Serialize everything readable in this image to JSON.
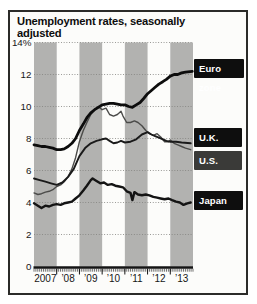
{
  "figure": {
    "title": "Unemployment rates, seasonally adjusted"
  },
  "colors": {
    "background": "#fcfcfa",
    "border": "#2b2b29",
    "year_band": "#b2b2b0",
    "gridline": "#82827f",
    "axis": "#141414",
    "tick_label": "#161616",
    "label_box_text": "#ffffff"
  },
  "chart_data": {
    "type": "line",
    "title": "Unemployment rates, seasonally adjusted",
    "unit": "percent",
    "xlabel": "",
    "ylabel": "",
    "x_range": [
      2007,
      2014
    ],
    "ylim": [
      0,
      14
    ],
    "grid": "dotted-horizontal",
    "shaded_year_bands": [
      2007,
      2009,
      2011,
      2013
    ],
    "y_ticks": [
      {
        "label": "14%",
        "value": 14
      },
      {
        "label": "12",
        "value": 12
      },
      {
        "label": "10",
        "value": 10
      },
      {
        "label": "8",
        "value": 8
      },
      {
        "label": "6",
        "value": 6
      },
      {
        "label": "4",
        "value": 4
      },
      {
        "label": "2",
        "value": 2
      },
      {
        "label": "0",
        "value": 0
      }
    ],
    "x_ticks": [
      {
        "label": "2007",
        "year": 2007
      },
      {
        "label": "’08",
        "year": 2008
      },
      {
        "label": "’09",
        "year": 2009
      },
      {
        "label": "’10",
        "year": 2010
      },
      {
        "label": "’11",
        "year": 2011
      },
      {
        "label": "’12",
        "year": 2012
      },
      {
        "label": "’13",
        "year": 2013
      }
    ],
    "legend": {
      "position": "right",
      "style": "black-label-boxes"
    },
    "series": [
      {
        "name": "Euro zone",
        "color": "#0d0d0d",
        "stroke_width": 2.8,
        "label_bg": "#0e0e0e",
        "points": [
          [
            2007.0,
            7.6
          ],
          [
            2007.17,
            7.55
          ],
          [
            2007.33,
            7.5
          ],
          [
            2007.5,
            7.5
          ],
          [
            2007.67,
            7.45
          ],
          [
            2007.83,
            7.4
          ],
          [
            2008.0,
            7.3
          ],
          [
            2008.17,
            7.3
          ],
          [
            2008.33,
            7.35
          ],
          [
            2008.5,
            7.5
          ],
          [
            2008.67,
            7.7
          ],
          [
            2008.83,
            8.0
          ],
          [
            2009.0,
            8.5
          ],
          [
            2009.17,
            8.9
          ],
          [
            2009.33,
            9.3
          ],
          [
            2009.5,
            9.6
          ],
          [
            2009.67,
            9.8
          ],
          [
            2009.83,
            9.95
          ],
          [
            2010.0,
            10.1
          ],
          [
            2010.17,
            10.15
          ],
          [
            2010.33,
            10.2
          ],
          [
            2010.5,
            10.2
          ],
          [
            2010.67,
            10.15
          ],
          [
            2010.83,
            10.1
          ],
          [
            2011.0,
            10.1
          ],
          [
            2011.17,
            10.0
          ],
          [
            2011.33,
            9.95
          ],
          [
            2011.5,
            10.1
          ],
          [
            2011.67,
            10.25
          ],
          [
            2011.83,
            10.5
          ],
          [
            2012.0,
            10.8
          ],
          [
            2012.17,
            11.0
          ],
          [
            2012.33,
            11.2
          ],
          [
            2012.5,
            11.4
          ],
          [
            2012.67,
            11.55
          ],
          [
            2012.83,
            11.7
          ],
          [
            2013.0,
            11.9
          ],
          [
            2013.17,
            12.0
          ],
          [
            2013.33,
            12.0
          ],
          [
            2013.5,
            12.1
          ],
          [
            2013.67,
            12.15
          ],
          [
            2013.97,
            12.2
          ]
        ]
      },
      {
        "name": "U.K.",
        "color": "#1a1a1a",
        "stroke_width": 1.9,
        "label_bg": "#0e0e0e",
        "points": [
          [
            2007.0,
            5.5
          ],
          [
            2007.25,
            5.4
          ],
          [
            2007.5,
            5.3
          ],
          [
            2007.75,
            5.2
          ],
          [
            2008.0,
            5.1
          ],
          [
            2008.25,
            5.25
          ],
          [
            2008.5,
            5.6
          ],
          [
            2008.75,
            6.1
          ],
          [
            2009.0,
            6.9
          ],
          [
            2009.25,
            7.4
          ],
          [
            2009.5,
            7.7
          ],
          [
            2009.75,
            7.85
          ],
          [
            2010.0,
            7.95
          ],
          [
            2010.17,
            8.0
          ],
          [
            2010.33,
            7.85
          ],
          [
            2010.5,
            7.7
          ],
          [
            2010.67,
            7.75
          ],
          [
            2010.83,
            7.85
          ],
          [
            2011.0,
            7.75
          ],
          [
            2011.25,
            7.8
          ],
          [
            2011.5,
            7.95
          ],
          [
            2011.75,
            8.25
          ],
          [
            2012.0,
            8.4
          ],
          [
            2012.17,
            8.25
          ],
          [
            2012.33,
            8.15
          ],
          [
            2012.5,
            8.05
          ],
          [
            2012.67,
            7.95
          ],
          [
            2012.83,
            7.85
          ],
          [
            2013.0,
            7.8
          ],
          [
            2013.25,
            7.8
          ],
          [
            2013.5,
            7.75
          ],
          [
            2013.9,
            7.7
          ]
        ]
      },
      {
        "name": "U.S.",
        "color": "#4b4b49",
        "stroke_width": 1.4,
        "label_bg": "#3a3a38",
        "points": [
          [
            2007.0,
            4.6
          ],
          [
            2007.17,
            4.5
          ],
          [
            2007.33,
            4.55
          ],
          [
            2007.5,
            4.65
          ],
          [
            2007.67,
            4.7
          ],
          [
            2007.83,
            4.8
          ],
          [
            2008.0,
            5.0
          ],
          [
            2008.17,
            5.1
          ],
          [
            2008.33,
            5.3
          ],
          [
            2008.5,
            5.6
          ],
          [
            2008.67,
            6.1
          ],
          [
            2008.83,
            6.8
          ],
          [
            2009.0,
            7.8
          ],
          [
            2009.17,
            8.5
          ],
          [
            2009.33,
            9.0
          ],
          [
            2009.5,
            9.5
          ],
          [
            2009.67,
            9.8
          ],
          [
            2009.83,
            10.0
          ],
          [
            2010.0,
            9.8
          ],
          [
            2010.17,
            9.9
          ],
          [
            2010.33,
            9.5
          ],
          [
            2010.5,
            9.4
          ],
          [
            2010.67,
            9.5
          ],
          [
            2010.83,
            9.7
          ],
          [
            2010.92,
            9.4
          ],
          [
            2011.08,
            9.0
          ],
          [
            2011.25,
            9.0
          ],
          [
            2011.42,
            9.1
          ],
          [
            2011.58,
            9.0
          ],
          [
            2011.75,
            8.8
          ],
          [
            2011.92,
            8.5
          ],
          [
            2012.08,
            8.3
          ],
          [
            2012.25,
            8.2
          ],
          [
            2012.42,
            8.3
          ],
          [
            2012.58,
            8.1
          ],
          [
            2012.75,
            7.8
          ],
          [
            2012.92,
            7.8
          ],
          [
            2013.0,
            7.9
          ],
          [
            2013.17,
            7.7
          ],
          [
            2013.33,
            7.6
          ],
          [
            2013.5,
            7.5
          ],
          [
            2013.67,
            7.4
          ],
          [
            2013.9,
            7.3
          ]
        ]
      },
      {
        "name": "Japan",
        "color": "#141414",
        "stroke_width": 2.4,
        "label_bg": "#0e0e0e",
        "points": [
          [
            2007.0,
            3.95
          ],
          [
            2007.17,
            3.8
          ],
          [
            2007.33,
            3.65
          ],
          [
            2007.5,
            3.8
          ],
          [
            2007.67,
            3.75
          ],
          [
            2007.83,
            3.85
          ],
          [
            2008.0,
            3.9
          ],
          [
            2008.17,
            3.85
          ],
          [
            2008.33,
            3.95
          ],
          [
            2008.5,
            4.0
          ],
          [
            2008.67,
            4.05
          ],
          [
            2008.83,
            4.25
          ],
          [
            2009.0,
            4.45
          ],
          [
            2009.17,
            4.75
          ],
          [
            2009.33,
            5.05
          ],
          [
            2009.5,
            5.4
          ],
          [
            2009.58,
            5.5
          ],
          [
            2009.75,
            5.35
          ],
          [
            2009.92,
            5.2
          ],
          [
            2010.08,
            5.25
          ],
          [
            2010.25,
            5.1
          ],
          [
            2010.42,
            5.15
          ],
          [
            2010.58,
            5.05
          ],
          [
            2010.75,
            5.0
          ],
          [
            2010.92,
            4.95
          ],
          [
            2011.08,
            4.7
          ],
          [
            2011.25,
            4.6
          ],
          [
            2011.33,
            4.15
          ],
          [
            2011.42,
            4.65
          ],
          [
            2011.58,
            4.5
          ],
          [
            2011.75,
            4.45
          ],
          [
            2011.92,
            4.5
          ],
          [
            2012.08,
            4.45
          ],
          [
            2012.25,
            4.35
          ],
          [
            2012.42,
            4.3
          ],
          [
            2012.58,
            4.25
          ],
          [
            2012.75,
            4.2
          ],
          [
            2012.92,
            4.25
          ],
          [
            2013.08,
            4.15
          ],
          [
            2013.25,
            4.05
          ],
          [
            2013.42,
            4.0
          ],
          [
            2013.58,
            3.85
          ],
          [
            2013.75,
            3.95
          ],
          [
            2013.9,
            4.0
          ]
        ]
      }
    ]
  }
}
